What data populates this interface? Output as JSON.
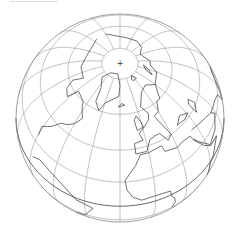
{
  "map": {
    "type": "orthographic-globe",
    "colors": {
      "background": "#ffffff",
      "graticule": "#9a9a9a",
      "coastline": "#333333",
      "outline": "#888888",
      "equator": "#555555"
    },
    "projection": {
      "center_x": 120,
      "center_y": 118,
      "radius": 104,
      "rotate_lon": -20,
      "tilt_lat": 58
    },
    "pole_marker": "+"
  }
}
